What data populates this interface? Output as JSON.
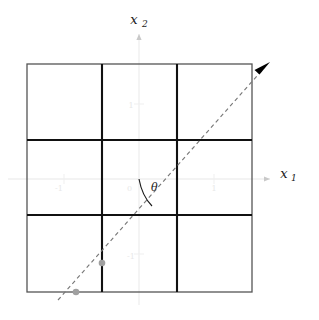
{
  "figure": {
    "type": "coordinate-grid-diagram",
    "width": 319,
    "height": 320,
    "background_color": "#ffffff"
  },
  "axes": {
    "horizontal": {
      "name": "x",
      "subscript": "1",
      "label": "x",
      "sub": "1",
      "color": "#efefef",
      "y_position": 179,
      "x_start": 8,
      "x_end": 272,
      "arrow": "right-arrow-icon"
    },
    "vertical": {
      "name": "x",
      "subscript": "2",
      "label": "x",
      "sub": "2",
      "color": "#efefef",
      "x_position": 139,
      "y_start": 305,
      "y_end": 32,
      "arrow": "up-arrow-icon"
    }
  },
  "grid": {
    "color_outer": "#4a4a4a",
    "color_inner": "#1a1a1a",
    "left": 27,
    "right": 252,
    "top": 64,
    "bottom": 292,
    "v_lines": [
      102,
      177
    ],
    "h_lines": [
      140,
      215
    ],
    "rows": 3,
    "cols": 3,
    "cell_fill": "#ffffff"
  },
  "ticks": {
    "color": "#ececec",
    "x1": [
      {
        "label": "-1",
        "x": 64,
        "y": 188
      },
      {
        "label": "1",
        "x": 214,
        "y": 188
      }
    ],
    "x2": [
      {
        "label": "1",
        "x": 131,
        "y": 107
      },
      {
        "label": "-1",
        "x": 128,
        "y": 260
      }
    ],
    "origin": {
      "label": "0",
      "x": 130,
      "y": 188
    }
  },
  "ray": {
    "name": "dashed-direction-ray",
    "style": "dashed",
    "color": "#6e6e6e",
    "stroke_width": 1,
    "dash_pattern": "4 3",
    "x_start": 58,
    "y_start": 300,
    "x_end": 268,
    "y_end": 64,
    "arrowhead": {
      "color": "#000000",
      "x": 268,
      "y": 64
    }
  },
  "points": [
    {
      "name": "point-lower",
      "x": 76,
      "y": 292,
      "radius": 3.2,
      "color": "#9a9a9a"
    },
    {
      "name": "point-upper",
      "x": 102,
      "y": 263,
      "radius": 3.2,
      "color": "#9a9a9a"
    }
  ],
  "angle": {
    "name": "theta-angle",
    "symbol": "θ",
    "label_x": 152,
    "label_y": 190,
    "arc_color": "#1a1a1a",
    "vertex_x": 139,
    "vertex_y": 179
  }
}
